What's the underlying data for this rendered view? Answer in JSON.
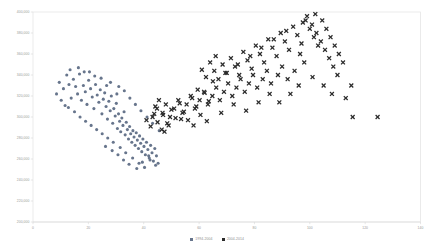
{
  "chart_data": {
    "type": "scatter",
    "title": "",
    "subtitle": "",
    "xlabel": "",
    "ylabel": "",
    "xlim": [
      0,
      140
    ],
    "ylim": [
      200000,
      400000
    ],
    "grid": false,
    "legend_position": "bottom-center",
    "x_ticks": [
      0,
      20,
      40,
      60,
      80,
      100,
      120,
      140
    ],
    "x_tick_labels": [
      "0",
      "20",
      "40",
      "60",
      "80",
      "100",
      "120",
      "140"
    ],
    "y_ticks": [
      200000,
      220000,
      240000,
      260000,
      280000,
      300000,
      320000,
      340000,
      360000,
      380000,
      400000
    ],
    "y_tick_labels": [
      "200,000",
      "220,000",
      "240,000",
      "260,000",
      "280,000",
      "300,000",
      "320,000",
      "340,000",
      "360,000",
      "380,000",
      "400,000"
    ],
    "series": [
      {
        "name": "1994-2004",
        "marker": "circle",
        "color": "#67758c",
        "points": [
          [
            9.5,
            333000
          ],
          [
            11.0,
            327000
          ],
          [
            12.2,
            340000
          ],
          [
            13.0,
            331000
          ],
          [
            13.8,
            318000
          ],
          [
            14.6,
            336000
          ],
          [
            15.4,
            329000
          ],
          [
            16.1,
            322000
          ],
          [
            16.8,
            341000
          ],
          [
            17.5,
            316000
          ],
          [
            18.2,
            330000
          ],
          [
            18.9,
            324000
          ],
          [
            19.5,
            312000
          ],
          [
            20.1,
            335000
          ],
          [
            20.8,
            327000
          ],
          [
            21.4,
            319000
          ],
          [
            22.0,
            308000
          ],
          [
            22.6,
            331000
          ],
          [
            23.2,
            321000
          ],
          [
            23.8,
            314000
          ],
          [
            24.3,
            326000
          ],
          [
            24.9,
            303000
          ],
          [
            25.4,
            317000
          ],
          [
            25.9,
            323000
          ],
          [
            26.4,
            310000
          ],
          [
            26.9,
            298000
          ],
          [
            27.4,
            315000
          ],
          [
            27.9,
            306000
          ],
          [
            28.3,
            320000
          ],
          [
            28.8,
            294000
          ],
          [
            29.2,
            308000
          ],
          [
            29.7,
            301000
          ],
          [
            30.1,
            313000
          ],
          [
            30.5,
            289000
          ],
          [
            30.9,
            303000
          ],
          [
            31.3,
            296000
          ],
          [
            31.7,
            286000
          ],
          [
            32.1,
            299000
          ],
          [
            32.5,
            292000
          ],
          [
            32.9,
            305000
          ],
          [
            33.3,
            283000
          ],
          [
            33.7,
            295000
          ],
          [
            34.1,
            288000
          ],
          [
            34.5,
            279000
          ],
          [
            34.9,
            291000
          ],
          [
            35.3,
            284000
          ],
          [
            35.7,
            276000
          ],
          [
            36.1,
            287000
          ],
          [
            36.5,
            281000
          ],
          [
            36.9,
            273000
          ],
          [
            37.3,
            285000
          ],
          [
            37.7,
            278000
          ],
          [
            38.1,
            270000
          ],
          [
            38.5,
            282000
          ],
          [
            38.9,
            275000
          ],
          [
            39.3,
            267000
          ],
          [
            39.7,
            279000
          ],
          [
            40.1,
            272000
          ],
          [
            40.6,
            264000
          ],
          [
            41.0,
            276000
          ],
          [
            41.5,
            269000
          ],
          [
            42.0,
            261000
          ],
          [
            42.5,
            273000
          ],
          [
            43.0,
            266000
          ],
          [
            43.5,
            258000
          ],
          [
            44.0,
            270000
          ],
          [
            44.6,
            263000
          ],
          [
            45.2,
            256000
          ],
          [
            12.8,
            309000
          ],
          [
            15.0,
            305000
          ],
          [
            17.0,
            300000
          ],
          [
            19.0,
            296000
          ],
          [
            21.0,
            292000
          ],
          [
            23.0,
            288000
          ],
          [
            25.0,
            284000
          ],
          [
            27.0,
            280000
          ],
          [
            8.5,
            322000
          ],
          [
            10.2,
            316000
          ],
          [
            11.6,
            311000
          ],
          [
            13.4,
            345000
          ],
          [
            16.4,
            347000
          ],
          [
            20.4,
            343000
          ],
          [
            24.6,
            337000
          ],
          [
            28.0,
            333000
          ],
          [
            31.0,
            329000
          ],
          [
            33.0,
            325000
          ],
          [
            35.0,
            318000
          ],
          [
            37.0,
            312000
          ],
          [
            39.0,
            306000
          ],
          [
            41.2,
            300000
          ],
          [
            43.2,
            294000
          ],
          [
            45.6,
            287000
          ],
          [
            29.0,
            276000
          ],
          [
            31.5,
            271000
          ],
          [
            33.5,
            266000
          ],
          [
            36.0,
            261000
          ],
          [
            38.3,
            256000
          ],
          [
            40.3,
            252000
          ],
          [
            42.3,
            259000
          ],
          [
            44.3,
            254000
          ],
          [
            26.2,
            272000
          ],
          [
            28.6,
            268000
          ],
          [
            30.7,
            264000
          ],
          [
            32.7,
            259000
          ],
          [
            34.7,
            255000
          ],
          [
            37.5,
            251000
          ],
          [
            39.5,
            257000
          ],
          [
            41.8,
            263000
          ],
          [
            18.5,
            343000
          ],
          [
            22.3,
            339000
          ],
          [
            26.6,
            330000
          ],
          [
            30.3,
            322000
          ]
        ]
      },
      {
        "name": "2004-2014",
        "marker": "cross",
        "color": "#2b2b2b",
        "points": [
          [
            41.0,
            297000
          ],
          [
            42.5,
            291000
          ],
          [
            43.8,
            303000
          ],
          [
            45.0,
            295000
          ],
          [
            46.5,
            288000
          ],
          [
            44.2,
            310000
          ],
          [
            47.0,
            302000
          ],
          [
            48.5,
            294000
          ],
          [
            50.0,
            307000
          ],
          [
            51.5,
            299000
          ],
          [
            53.0,
            313000
          ],
          [
            54.5,
            305000
          ],
          [
            56.0,
            297000
          ],
          [
            57.5,
            318000
          ],
          [
            59.0,
            310000
          ],
          [
            60.5,
            302000
          ],
          [
            62.0,
            323000
          ],
          [
            63.5,
            315000
          ],
          [
            61.0,
            345000
          ],
          [
            62.5,
            338000
          ],
          [
            64.0,
            352000
          ],
          [
            65.5,
            344000
          ],
          [
            67.0,
            336000
          ],
          [
            66.0,
            358000
          ],
          [
            68.5,
            350000
          ],
          [
            70.0,
            342000
          ],
          [
            71.5,
            356000
          ],
          [
            73.0,
            348000
          ],
          [
            74.5,
            340000
          ],
          [
            76.0,
            362000
          ],
          [
            77.5,
            354000
          ],
          [
            79.0,
            346000
          ],
          [
            80.5,
            368000
          ],
          [
            82.0,
            360000
          ],
          [
            83.5,
            352000
          ],
          [
            85.0,
            374000
          ],
          [
            86.5,
            366000
          ],
          [
            88.0,
            358000
          ],
          [
            89.5,
            380000
          ],
          [
            91.0,
            372000
          ],
          [
            92.5,
            364000
          ],
          [
            94.0,
            386000
          ],
          [
            95.5,
            378000
          ],
          [
            97.0,
            370000
          ],
          [
            98.5,
            392000
          ],
          [
            100.0,
            384000
          ],
          [
            101.5,
            376000
          ],
          [
            103.0,
            368000
          ],
          [
            99.0,
            396000
          ],
          [
            100.8,
            388000
          ],
          [
            102.4,
            380000
          ],
          [
            104.0,
            372000
          ],
          [
            105.5,
            364000
          ],
          [
            107.0,
            356000
          ],
          [
            108.5,
            348000
          ],
          [
            110.0,
            340000
          ],
          [
            96.5,
            360000
          ],
          [
            98.0,
            352000
          ],
          [
            94.5,
            344000
          ],
          [
            92.0,
            336000
          ],
          [
            90.0,
            348000
          ],
          [
            88.5,
            340000
          ],
          [
            86.0,
            332000
          ],
          [
            84.5,
            344000
          ],
          [
            83.0,
            336000
          ],
          [
            81.0,
            328000
          ],
          [
            79.5,
            340000
          ],
          [
            78.0,
            332000
          ],
          [
            76.5,
            324000
          ],
          [
            75.0,
            336000
          ],
          [
            73.5,
            328000
          ],
          [
            72.0,
            320000
          ],
          [
            70.5,
            332000
          ],
          [
            69.0,
            324000
          ],
          [
            67.5,
            316000
          ],
          [
            66.2,
            328000
          ],
          [
            64.8,
            320000
          ],
          [
            63.2,
            312000
          ],
          [
            61.8,
            324000
          ],
          [
            60.2,
            316000
          ],
          [
            58.5,
            308000
          ],
          [
            57.0,
            320000
          ],
          [
            55.5,
            312000
          ],
          [
            54.0,
            304000
          ],
          [
            52.5,
            316000
          ],
          [
            51.0,
            308000
          ],
          [
            49.5,
            300000
          ],
          [
            48.0,
            312000
          ],
          [
            46.8,
            304000
          ],
          [
            45.5,
            316000
          ],
          [
            44.8,
            308000
          ],
          [
            43.2,
            300000
          ],
          [
            104.5,
            392000
          ],
          [
            106.0,
            384000
          ],
          [
            107.5,
            376000
          ],
          [
            109.0,
            368000
          ],
          [
            110.5,
            360000
          ],
          [
            112.0,
            352000
          ],
          [
            102.0,
            398000
          ],
          [
            97.5,
            390000
          ],
          [
            91.5,
            382000
          ],
          [
            87.0,
            374000
          ],
          [
            82.5,
            366000
          ],
          [
            78.5,
            358000
          ],
          [
            74.0,
            350000
          ],
          [
            69.5,
            342000
          ],
          [
            65.0,
            334000
          ],
          [
            59.5,
            326000
          ],
          [
            115.5,
            300000
          ],
          [
            124.5,
            300000
          ],
          [
            113.0,
            318000
          ],
          [
            115.0,
            330000
          ],
          [
            108.0,
            322000
          ],
          [
            105.0,
            330000
          ],
          [
            101.0,
            338000
          ],
          [
            96.0,
            330000
          ],
          [
            93.0,
            322000
          ],
          [
            89.0,
            314000
          ],
          [
            85.5,
            322000
          ],
          [
            81.5,
            314000
          ],
          [
            77.0,
            306000
          ],
          [
            72.5,
            312000
          ],
          [
            68.0,
            304000
          ],
          [
            62.8,
            296000
          ],
          [
            58.0,
            292000
          ],
          [
            53.5,
            298000
          ],
          [
            49.0,
            292000
          ],
          [
            47.5,
            286000
          ]
        ]
      }
    ]
  },
  "legend": {
    "items": [
      {
        "label": "1994-2004",
        "color": "#67758c",
        "marker": "square"
      },
      {
        "label": "2004-2014",
        "color": "#2b2b2b",
        "marker": "square"
      }
    ]
  }
}
